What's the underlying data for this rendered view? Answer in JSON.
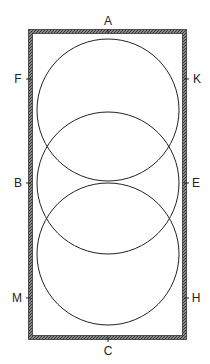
{
  "diagram": {
    "type": "geometric-construction",
    "colors": {
      "stroke": "#222222",
      "border": "#555555",
      "background": "#ffffff"
    },
    "rectangle": {
      "x": 32,
      "y": 33,
      "width": 151,
      "height": 303
    },
    "circles": [
      {
        "id": "top",
        "cx": 108,
        "cy": 110,
        "r": 71
      },
      {
        "id": "middle",
        "cx": 108,
        "cy": 183,
        "r": 71
      },
      {
        "id": "bottom",
        "cx": 108,
        "cy": 254,
        "r": 71
      }
    ],
    "labels": {
      "A": "A",
      "B": "B",
      "C": "C",
      "E": "E",
      "F": "F",
      "H": "H",
      "K": "K",
      "M": "M"
    }
  }
}
